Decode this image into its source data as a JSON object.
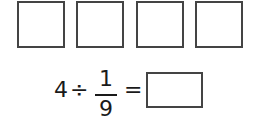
{
  "blanks": [
    {
      "value": ""
    },
    {
      "value": ""
    },
    {
      "value": ""
    },
    {
      "value": ""
    }
  ],
  "equation": {
    "dividend": "4",
    "operator": "÷",
    "fraction": {
      "numerator": "1",
      "denominator": "9"
    },
    "equals": "=",
    "answer": ""
  }
}
